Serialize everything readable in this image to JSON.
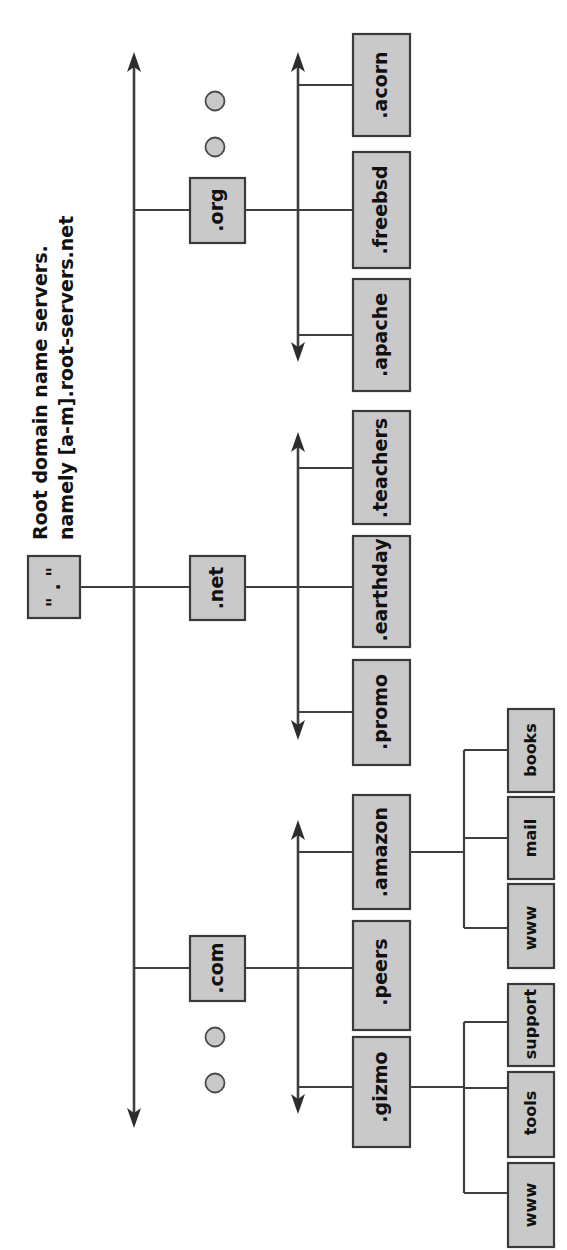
{
  "diagram": {
    "orientation": "rotated-90-ccw",
    "colors": {
      "node_fill": "#c9c9c9",
      "node_stroke": "#3a3a3a",
      "edge": "#3f3f3f",
      "background": "#ffffff",
      "text": "#111111"
    },
    "annotation": {
      "line1": "Root domain name servers.",
      "line2": "namely [a-m].root-servers.net"
    },
    "root": {
      "label": "\" . \"",
      "label_plain": "\".\""
    },
    "tlds": [
      {
        "id": "org",
        "label": ".org"
      },
      {
        "id": "net",
        "label": ".net"
      },
      {
        "id": "com",
        "label": ".com"
      }
    ],
    "second_level": {
      "org": [
        {
          "id": "acorn",
          "label": ".acorn"
        },
        {
          "id": "freebsd",
          "label": ".freebsd"
        },
        {
          "id": "apache",
          "label": ".apache"
        }
      ],
      "net": [
        {
          "id": "teachers",
          "label": ".teachers"
        },
        {
          "id": "earthday",
          "label": ".earthday"
        },
        {
          "id": "promo",
          "label": ".promo"
        }
      ],
      "com": [
        {
          "id": "amazon",
          "label": ".amazon"
        },
        {
          "id": "peers",
          "label": ".peers"
        },
        {
          "id": "gizmo",
          "label": ".gizmo"
        }
      ]
    },
    "third_level": {
      "amazon": [
        {
          "id": "amazon-books",
          "label": "books"
        },
        {
          "id": "amazon-mail",
          "label": "mail"
        },
        {
          "id": "amazon-www",
          "label": "www"
        }
      ],
      "gizmo": [
        {
          "id": "gizmo-support",
          "label": "support"
        },
        {
          "id": "gizmo-tools",
          "label": "tools"
        },
        {
          "id": "gizmo-www",
          "label": "www"
        }
      ]
    },
    "ellipsis_groups": [
      {
        "id": "ellipsis-above-org",
        "count": 2
      },
      {
        "id": "ellipsis-below-com",
        "count": 2
      }
    ]
  }
}
